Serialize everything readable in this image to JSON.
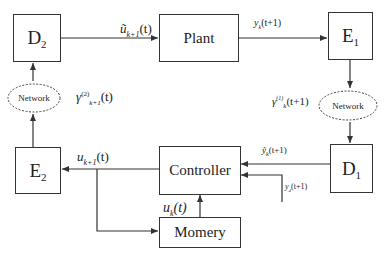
{
  "blocks": {
    "d2": {
      "main": "D",
      "sub": "2"
    },
    "plant": {
      "label": "Plant"
    },
    "e1": {
      "main": "E",
      "sub": "1"
    },
    "e2": {
      "main": "E",
      "sub": "2"
    },
    "controller": {
      "label": "Controller"
    },
    "d1": {
      "main": "D",
      "sub": "1"
    },
    "memory": {
      "label": "Momery"
    }
  },
  "networks": {
    "left": {
      "label": "Network"
    },
    "right": {
      "label": "Network"
    }
  },
  "signals": {
    "u_tilde": {
      "base": "ũ",
      "sub": "k+1",
      "arg": "(t)"
    },
    "y_k": {
      "base": "y",
      "sub": "k",
      "arg": "(t+1)"
    },
    "gamma1": {
      "base": "γ",
      "sup": "(1)",
      "sub": "k",
      "arg": "(t+1)"
    },
    "gamma2": {
      "base": "γ",
      "sup": "(2)",
      "sub": "k+1",
      "arg": "(t)"
    },
    "u_k1": {
      "base": "u",
      "sub": "k+1",
      "arg": "(t)"
    },
    "y_tilde": {
      "base": "ỹ",
      "sub": "k",
      "arg": "(t+1)"
    },
    "y_d": {
      "base": "y",
      "sub": "d",
      "arg": "(t+1)"
    },
    "u_k": {
      "base": "u",
      "sub": "k",
      "arg": "(t)"
    }
  },
  "colors": {
    "line": "#333333",
    "background": "#ffffff"
  }
}
